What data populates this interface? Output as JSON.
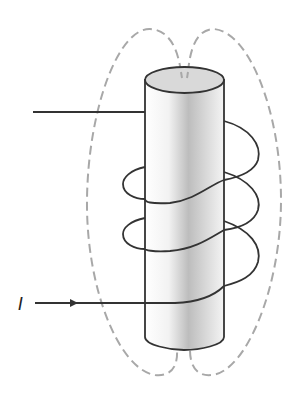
{
  "diagram": {
    "title": "",
    "labels": {
      "current": "I"
    },
    "colors": {
      "wire": "#333333",
      "field_lines": "#a8a8a8",
      "core_top": "#d9d9d9",
      "core_outline": "#333333"
    },
    "elements": {
      "core": "cylinder",
      "coil_turns": 3,
      "field_lines": "dashed",
      "current_arrow": "right"
    }
  }
}
